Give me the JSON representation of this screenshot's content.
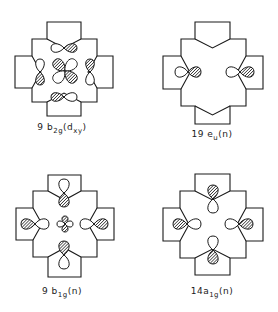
{
  "figure": {
    "hatch_color": "#1a1a1a",
    "line_color": "#1a1a1a",
    "background": "#ffffff"
  },
  "panels": [
    {
      "id": "9b2g",
      "label": {
        "prefix": "9 b",
        "sub": "2g",
        "suffix": "(d",
        "sub2": "xy",
        "suffix2": ")",
        "x": 62,
        "y": 122
      },
      "center": [
        65,
        71
      ],
      "outline": {
        "x0": 32,
        "x1": 97,
        "y0": 39,
        "y1": 102,
        "tab_top": 22,
        "tab_bottom": 116,
        "tab_left": 15,
        "tab_right": 113,
        "tab_x0": 47,
        "tab_x1": 81,
        "tab_y0": 56,
        "tab_y1": 88,
        "notch": "in"
      },
      "orbitals": [
        {
          "type": "dxy",
          "cx": 65,
          "cy": 71,
          "size": 15,
          "hatched": [
            "ul",
            "lr"
          ]
        },
        {
          "type": "p",
          "cx": 64,
          "cy": 48,
          "dir": "h",
          "len": 13,
          "w": 5,
          "hatched": "pos"
        },
        {
          "type": "p",
          "cx": 64,
          "cy": 97,
          "dir": "h",
          "len": 13,
          "w": 5,
          "hatched": "neg"
        },
        {
          "type": "p",
          "cx": 40,
          "cy": 72,
          "dir": "v",
          "len": 13,
          "w": 5,
          "hatched": "pos"
        },
        {
          "type": "p",
          "cx": 90,
          "cy": 72,
          "dir": "v",
          "len": 13,
          "w": 5,
          "hatched": "neg"
        }
      ]
    },
    {
      "id": "19eu",
      "label": {
        "prefix": "19 e",
        "sub": "u",
        "suffix": "(n)",
        "sub2": "",
        "suffix2": "",
        "x": 212,
        "y": 129
      },
      "center": [
        213,
        72
      ],
      "outline": {
        "x0": 181,
        "x1": 246,
        "y0": 39,
        "y1": 106,
        "tab_top": 22,
        "tab_bottom": 124,
        "tab_left": 163,
        "tab_right": 263,
        "tab_x0": 195,
        "tab_x1": 230,
        "tab_y0": 56,
        "tab_y1": 89,
        "notch": "mixed"
      },
      "orbitals": [
        {
          "type": "p",
          "cx": 188,
          "cy": 72,
          "dir": "h",
          "len": 13,
          "w": 6,
          "hatched": "pos"
        },
        {
          "type": "p",
          "cx": 240,
          "cy": 72,
          "dir": "h",
          "len": 14,
          "w": 6,
          "hatched": "pos"
        }
      ]
    },
    {
      "id": "9b1g",
      "label": {
        "prefix": "9 b",
        "sub": "1g",
        "suffix": "(n)",
        "sub2": "",
        "suffix2": "",
        "x": 62,
        "y": 286
      },
      "center": [
        65,
        224
      ],
      "outline": {
        "x0": 33,
        "x1": 97,
        "y0": 191,
        "y1": 257,
        "tab_top": 175,
        "tab_bottom": 277,
        "tab_left": 16,
        "tab_right": 114,
        "tab_x0": 48,
        "tab_x1": 81,
        "tab_y0": 208,
        "tab_y1": 240,
        "notch": "in"
      },
      "orbitals": [
        {
          "type": "dx2y2",
          "cx": 65,
          "cy": 224,
          "size": 8,
          "hatched": "v"
        },
        {
          "type": "p",
          "cx": 64,
          "cy": 193,
          "dir": "v",
          "len": 14,
          "w": 6,
          "hatched": "pos"
        },
        {
          "type": "p",
          "cx": 64,
          "cy": 255,
          "dir": "v",
          "len": 14,
          "w": 6,
          "hatched": "neg"
        },
        {
          "type": "p",
          "cx": 35,
          "cy": 224,
          "dir": "h",
          "len": 14,
          "w": 6,
          "hatched": "neg"
        },
        {
          "type": "p",
          "cx": 94,
          "cy": 224,
          "dir": "h",
          "len": 14,
          "w": 6,
          "hatched": "pos"
        }
      ]
    },
    {
      "id": "14a1g",
      "label": {
        "prefix": "14a",
        "sub": "1g",
        "suffix": "(n)",
        "sub2": "",
        "suffix2": "",
        "x": 212,
        "y": 286
      },
      "center": [
        213,
        224
      ],
      "outline": {
        "x0": 180,
        "x1": 246,
        "y0": 191,
        "y1": 258,
        "tab_top": 174,
        "tab_bottom": 275,
        "tab_left": 163,
        "tab_right": 263,
        "tab_x0": 195,
        "tab_x1": 230,
        "tab_y0": 208,
        "tab_y1": 241,
        "notch": "in"
      },
      "orbitals": [
        {
          "type": "p",
          "cx": 213,
          "cy": 199,
          "dir": "v",
          "len": 14,
          "w": 6,
          "hatched": "neg"
        },
        {
          "type": "p",
          "cx": 213,
          "cy": 250,
          "dir": "v",
          "len": 14,
          "w": 6,
          "hatched": "pos"
        },
        {
          "type": "p",
          "cx": 187,
          "cy": 224,
          "dir": "h",
          "len": 14,
          "w": 6,
          "hatched": "neg"
        },
        {
          "type": "p",
          "cx": 239,
          "cy": 224,
          "dir": "h",
          "len": 14,
          "w": 6,
          "hatched": "pos"
        }
      ]
    }
  ]
}
